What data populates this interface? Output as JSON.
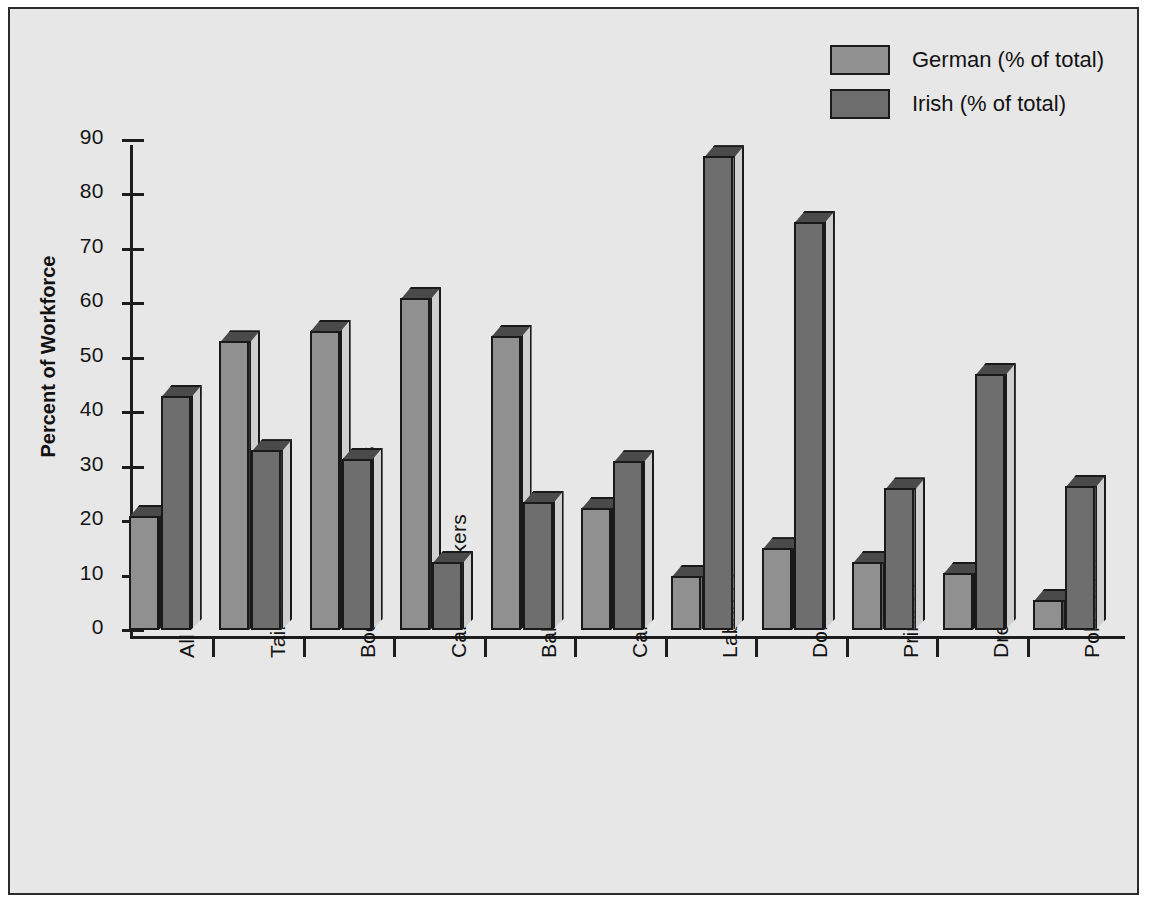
{
  "figure": {
    "background_color": "#e7e7e7",
    "frame_color": "#2b2b2b"
  },
  "legend": {
    "position": "top-right",
    "entries": [
      {
        "label": "German (% of total)",
        "color": "#909090"
      },
      {
        "label": "Irish (% of total)",
        "color": "#6e6e6e"
      }
    ]
  },
  "chart_data": {
    "type": "bar",
    "title": "",
    "subtitle": "",
    "xlabel": "",
    "ylabel": "Percent of Workforce",
    "ylim": [
      0,
      90
    ],
    "ytick_labels": [
      "0",
      "10",
      "20",
      "30",
      "40",
      "50",
      "60",
      "70",
      "80",
      "90"
    ],
    "ytick_values": [
      0,
      10,
      20,
      30,
      40,
      50,
      60,
      70,
      80,
      90
    ],
    "grid": false,
    "style": "3d-grouped-columns",
    "legend_position": "top-right",
    "categories": [
      "All Occupations",
      "Tailors",
      "Boot and Shoemakers",
      "Cabinetmakers",
      "Bakers",
      "Carpenters",
      "Laborers",
      "Domestic Servants",
      "Printers",
      "Dressmakers",
      "Policemen"
    ],
    "series": [
      {
        "name": "German (% of total)",
        "color": "#909090",
        "values": [
          21,
          53,
          55,
          61,
          54,
          22.5,
          10,
          15,
          12.5,
          10.5,
          5.5
        ]
      },
      {
        "name": "Irish (% of total)",
        "color": "#6e6e6e",
        "values": [
          43,
          33,
          31.5,
          12.5,
          23.5,
          31,
          87,
          75,
          26,
          47,
          26.5
        ]
      }
    ]
  }
}
